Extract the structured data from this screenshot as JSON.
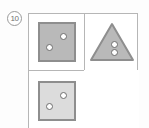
{
  "item": {
    "number": "10"
  },
  "grid": {
    "rows": 2,
    "columns": 2,
    "cells": [
      {
        "position": "top-left",
        "shape": "square",
        "fill_color": "#b9b9b9",
        "border_color": "#8e8e8e",
        "dot_count": 2,
        "dot_arrangement": "diagonal",
        "dot_color": "#ffffff",
        "empty": false
      },
      {
        "position": "top-right",
        "shape": "triangle",
        "fill_color": "#b9b9b9",
        "border_color": "#8e8e8e",
        "dot_count": 2,
        "dot_arrangement": "vertical-stack",
        "dot_color": "#ffffff",
        "empty": false
      },
      {
        "position": "bottom-left",
        "shape": "square",
        "fill_color": "#dcdcdc",
        "border_color": "#8e8e8e",
        "dot_count": 2,
        "dot_arrangement": "diagonal",
        "dot_color": "#ffffff",
        "empty": false
      },
      {
        "position": "bottom-right",
        "shape": "none",
        "fill_color": "#ffffff",
        "border_color": "#ffffff",
        "dot_count": 0,
        "dot_arrangement": "none",
        "dot_color": "#ffffff",
        "empty": true
      }
    ],
    "border_color": "#b6b6b6"
  }
}
